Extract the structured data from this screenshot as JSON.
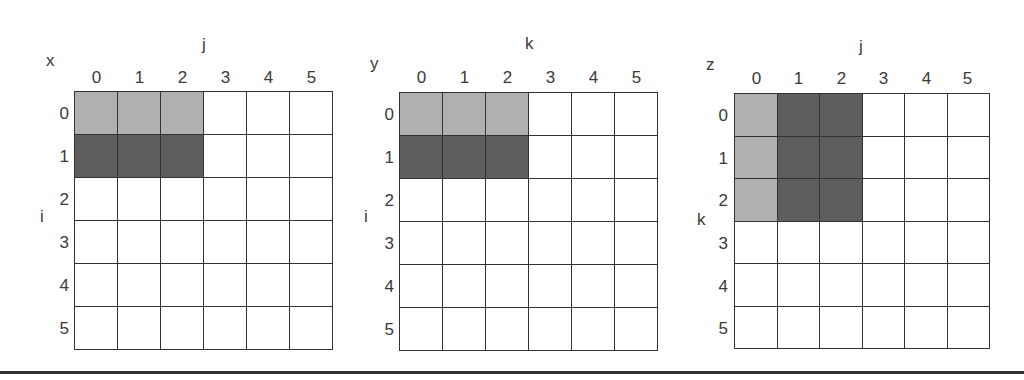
{
  "figure": {
    "panels": [
      {
        "array_name": "x",
        "col_axis": "j",
        "row_axis": "i",
        "col_ticks": [
          "0",
          "1",
          "2",
          "3",
          "4",
          "5"
        ],
        "row_ticks": [
          "0",
          "1",
          "2",
          "3",
          "4",
          "5"
        ],
        "cells": [
          [
            "light",
            "light",
            "light",
            "",
            "",
            ""
          ],
          [
            "dark",
            "dark",
            "dark",
            "",
            "",
            ""
          ],
          [
            "",
            "",
            "",
            "",
            "",
            ""
          ],
          [
            "",
            "",
            "",
            "",
            "",
            ""
          ],
          [
            "",
            "",
            "",
            "",
            "",
            ""
          ],
          [
            "",
            "",
            "",
            "",
            "",
            ""
          ]
        ]
      },
      {
        "array_name": "y",
        "col_axis": "k",
        "row_axis": "i",
        "col_ticks": [
          "0",
          "1",
          "2",
          "3",
          "4",
          "5"
        ],
        "row_ticks": [
          "0",
          "1",
          "2",
          "3",
          "4",
          "5"
        ],
        "cells": [
          [
            "light",
            "light",
            "light",
            "",
            "",
            ""
          ],
          [
            "dark",
            "dark",
            "dark",
            "",
            "",
            ""
          ],
          [
            "",
            "",
            "",
            "",
            "",
            ""
          ],
          [
            "",
            "",
            "",
            "",
            "",
            ""
          ],
          [
            "",
            "",
            "",
            "",
            "",
            ""
          ],
          [
            "",
            "",
            "",
            "",
            "",
            ""
          ]
        ]
      },
      {
        "array_name": "z",
        "col_axis": "j",
        "row_axis": "k",
        "col_ticks": [
          "0",
          "1",
          "2",
          "3",
          "4",
          "5"
        ],
        "row_ticks": [
          "0",
          "1",
          "2",
          "3",
          "4",
          "5"
        ],
        "cells": [
          [
            "light",
            "dark",
            "dark",
            "",
            "",
            ""
          ],
          [
            "light",
            "dark",
            "dark",
            "",
            "",
            ""
          ],
          [
            "light",
            "dark",
            "dark",
            "",
            "",
            ""
          ],
          [
            "",
            "",
            "",
            "",
            "",
            ""
          ],
          [
            "",
            "",
            "",
            "",
            "",
            ""
          ],
          [
            "",
            "",
            "",
            "",
            "",
            ""
          ]
        ]
      }
    ],
    "colors": {
      "light_shade": "#b0b0b0",
      "dark_shade": "#5e5e5e",
      "grid_line": "#333333",
      "background": "#ffffff"
    }
  }
}
